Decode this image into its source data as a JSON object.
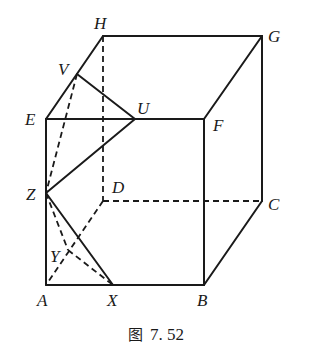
{
  "figure": {
    "caption_prefix": "图",
    "caption_number": "7. 52",
    "vertices": {
      "A": {
        "label": "A",
        "x": 46,
        "y": 285
      },
      "B": {
        "label": "B",
        "x": 204,
        "y": 285
      },
      "C": {
        "label": "C",
        "x": 262,
        "y": 201
      },
      "D": {
        "label": "D",
        "x": 103,
        "y": 201
      },
      "E": {
        "label": "E",
        "x": 46,
        "y": 119
      },
      "F": {
        "label": "F",
        "x": 204,
        "y": 119
      },
      "G": {
        "label": "G",
        "x": 262,
        "y": 36
      },
      "H": {
        "label": "H",
        "x": 103,
        "y": 36
      },
      "U": {
        "label": "U",
        "x": 135,
        "y": 119
      },
      "V": {
        "label": "V",
        "x": 77,
        "y": 74
      },
      "X": {
        "label": "X",
        "x": 113,
        "y": 285
      },
      "Y": {
        "label": "Y",
        "x": 68,
        "y": 250
      },
      "Z": {
        "label": "Z",
        "x": 46,
        "y": 193
      }
    },
    "solid_edges": [
      "A-B",
      "B-F",
      "F-E",
      "E-A",
      "E-H",
      "H-G",
      "G-F",
      "G-C",
      "C-B",
      "V-U",
      "U-Z",
      "Z-X"
    ],
    "dashed_edges": [
      "H-D",
      "D-C",
      "D-A",
      "V-Z",
      "Z-Y",
      "Y-X"
    ]
  }
}
